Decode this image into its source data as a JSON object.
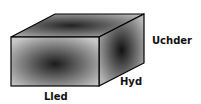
{
  "diagram": {
    "type": "cuboid",
    "labels": {
      "width": "Lled",
      "length": "Hyd",
      "height": "Uchder"
    },
    "colors": {
      "face_dark": "#1a1a1a",
      "face_light": "#c8c8c8",
      "outline": "#000000",
      "background": "#ffffff"
    }
  }
}
